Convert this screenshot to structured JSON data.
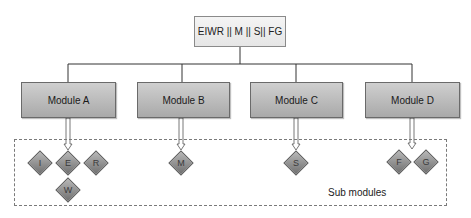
{
  "diagram": {
    "root": {
      "label": "EIWR || M || S|| FG"
    },
    "modules": [
      {
        "label": "Module A",
        "x": 21,
        "width": 95,
        "cx": 68
      },
      {
        "label": "Module B",
        "x": 137,
        "width": 93,
        "cx": 182
      },
      {
        "label": "Module C",
        "x": 250,
        "width": 93,
        "cx": 296
      },
      {
        "label": "Module D",
        "x": 365,
        "width": 95,
        "cx": 412
      }
    ],
    "submodules": [
      {
        "label": "I",
        "cx": 40,
        "cy": 163,
        "parent": "Module A"
      },
      {
        "label": "E",
        "cx": 68,
        "cy": 163,
        "parent": "Module A"
      },
      {
        "label": "R",
        "cx": 96,
        "cy": 163,
        "parent": "Module A"
      },
      {
        "label": "W",
        "cx": 68,
        "cy": 190,
        "parent": "Module A"
      },
      {
        "label": "M",
        "cx": 181,
        "cy": 163,
        "parent": "Module B"
      },
      {
        "label": "S",
        "cx": 296,
        "cy": 163,
        "parent": "Module C"
      },
      {
        "label": "F",
        "cx": 399,
        "cy": 162,
        "parent": "Module D"
      },
      {
        "label": "G",
        "cx": 426,
        "cy": 162,
        "parent": "Module D"
      }
    ],
    "region_label": "Sub modules",
    "colors": {
      "root_fill": "#eeeeee",
      "module_fill": "#bdbdbd",
      "diamond_fill": "#939393",
      "line": "#333333"
    }
  }
}
